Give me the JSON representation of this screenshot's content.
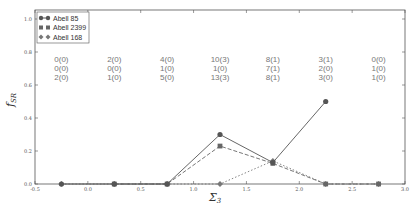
{
  "chart_data": {
    "type": "line",
    "title": "",
    "xlabel": "Σ3",
    "ylabel": "f_SR",
    "xlim": [
      -0.5,
      3.0
    ],
    "ylim": [
      0.0,
      1.0
    ],
    "x_ticks": [
      "-0.5",
      "0.0",
      "0.5",
      "1.0",
      "1.5",
      "2.0",
      "2.5",
      "3.0"
    ],
    "y_ticks": [
      "0.0",
      "0.2",
      "0.4",
      "0.6",
      "0.8",
      "1.0"
    ],
    "grid": false,
    "legend_position": "upper left",
    "x": [
      -0.25,
      0.25,
      0.75,
      1.25,
      1.75,
      2.25,
      2.75
    ],
    "series": [
      {
        "name": "Abell 85",
        "marker": "circle",
        "linestyle": "solid",
        "color": "#555555",
        "values": [
          0.0,
          0.0,
          0.0,
          0.3,
          0.13,
          0.5,
          null
        ]
      },
      {
        "name": "Abell 2399",
        "marker": "square",
        "linestyle": "dashed",
        "color": "#666666",
        "values": [
          null,
          0.0,
          0.0,
          0.23,
          0.125,
          0.0,
          0.0
        ]
      },
      {
        "name": "Abell 168",
        "marker": "diamond",
        "linestyle": "dotted",
        "color": "#777777",
        "values": [
          0.0,
          0.0,
          0.0,
          0.0,
          0.14,
          0.0,
          0.0
        ]
      }
    ],
    "annotations": [
      {
        "x": -0.25,
        "lines": [
          "0(0)",
          "0(0)",
          "2(0)"
        ]
      },
      {
        "x": 0.25,
        "lines": [
          "2(0)",
          "0(0)",
          "1(0)"
        ]
      },
      {
        "x": 0.75,
        "lines": [
          "4(0)",
          "1(0)",
          "5(0)"
        ]
      },
      {
        "x": 1.25,
        "lines": [
          "10(3)",
          "1(0)",
          "13(3)"
        ]
      },
      {
        "x": 1.75,
        "lines": [
          "8(1)",
          "7(1)",
          "8(1)"
        ]
      },
      {
        "x": 2.25,
        "lines": [
          "3(1)",
          "2(0)",
          "3(0)"
        ]
      },
      {
        "x": 2.75,
        "lines": [
          "0(0)",
          "1(0)",
          "1(0)"
        ]
      }
    ]
  },
  "legend": {
    "items": [
      {
        "label": "Abell 85"
      },
      {
        "label": "Abell 2399"
      },
      {
        "label": "Abell 168"
      }
    ]
  },
  "axes": {
    "xlabel": "Σ",
    "xlabel_sub": "3",
    "ylabel": "f",
    "ylabel_sub": "SR"
  }
}
